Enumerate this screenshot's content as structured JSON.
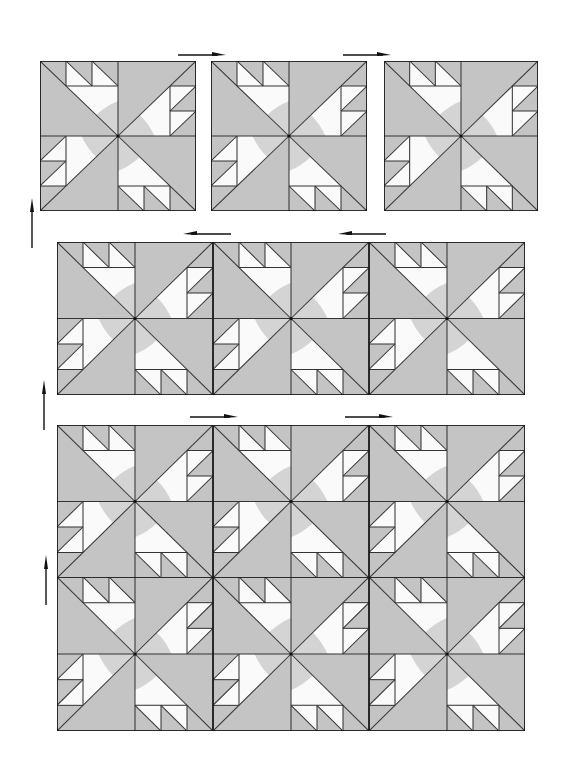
{
  "diagram": {
    "title": "",
    "colors": {
      "background_fabric": "#c4c4c4",
      "print_fabric": "#fafafa",
      "print_dots": "#d6d6d6",
      "seam_line": "#333333",
      "block_border": "#1a1a1a",
      "arrow": "#111111"
    },
    "rows": [
      {
        "id": "row-1",
        "blocks": 3,
        "joined": false,
        "arrows": [
          "right",
          "right"
        ],
        "side_arrow": "up"
      },
      {
        "id": "row-2",
        "blocks": 3,
        "joined": true,
        "arrows": [
          "left",
          "left"
        ],
        "side_arrow": "up"
      },
      {
        "id": "row-3",
        "blocks": 3,
        "joined": true,
        "arrows": [
          "right",
          "right"
        ],
        "side_arrow": "up"
      },
      {
        "id": "row-4",
        "blocks": 3,
        "joined": true,
        "arrows": [],
        "side_arrow": null
      }
    ],
    "block_count": 12
  }
}
